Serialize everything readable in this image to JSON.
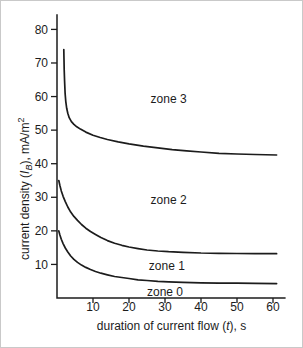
{
  "figure": {
    "background": "#ffffff",
    "border_color": "#c9c9c9",
    "ink_color": "#1c1c1c"
  },
  "axes": {
    "y_title": {
      "pre": "current density (",
      "var": "I",
      "sub": "B",
      "post": "), mA/m",
      "sup": "2"
    },
    "x_title": {
      "pre": "duration of current flow (",
      "var": "t",
      "post": "), s"
    }
  },
  "chart_data": {
    "type": "line",
    "title": "",
    "xlabel": "duration of current flow (t), s",
    "ylabel": "current density (I_B), mA/m^2",
    "xlim": [
      0,
      63.5
    ],
    "ylim": [
      0,
      84.5
    ],
    "x_ticks": [
      10,
      20,
      30,
      40,
      50,
      60
    ],
    "y_ticks": [
      10,
      20,
      30,
      40,
      50,
      60,
      70,
      80
    ],
    "grid": false,
    "legend": "none",
    "line_color": "#1c1c1c",
    "line_width": 1.7,
    "series": [
      {
        "name": "zone2-zone3-boundary",
        "points": [
          [
            1.9,
            74
          ],
          [
            1.95,
            71
          ],
          [
            2.0,
            68
          ],
          [
            2.1,
            64.5
          ],
          [
            2.25,
            61
          ],
          [
            2.45,
            58.5
          ],
          [
            2.7,
            56.5
          ],
          [
            3.0,
            55
          ],
          [
            3.4,
            53.7
          ],
          [
            4.0,
            52.5
          ],
          [
            4.7,
            51.7
          ],
          [
            5.5,
            51
          ],
          [
            6.5,
            50.3
          ],
          [
            8,
            49.4
          ],
          [
            10,
            48.5
          ],
          [
            12,
            47.8
          ],
          [
            14,
            47.2
          ],
          [
            17,
            46.5
          ],
          [
            20,
            45.9
          ],
          [
            24,
            45.2
          ],
          [
            28,
            44.7
          ],
          [
            32,
            44.2
          ],
          [
            36,
            43.8
          ],
          [
            40,
            43.5
          ],
          [
            45,
            43.1
          ],
          [
            50,
            42.9
          ],
          [
            55,
            42.75
          ],
          [
            61,
            42.6
          ]
        ]
      },
      {
        "name": "zone1-zone2-boundary",
        "points": [
          [
            0.5,
            35
          ],
          [
            0.8,
            33.5
          ],
          [
            1.2,
            31.9
          ],
          [
            1.7,
            30.3
          ],
          [
            2.3,
            28.7
          ],
          [
            3.0,
            27.1
          ],
          [
            3.8,
            25.6
          ],
          [
            4.7,
            24.3
          ],
          [
            5.7,
            23.1
          ],
          [
            6.8,
            21.9
          ],
          [
            8.0,
            20.8
          ],
          [
            9.3,
            19.8
          ],
          [
            10.7,
            18.9
          ],
          [
            12.2,
            18.0
          ],
          [
            14,
            17.1
          ],
          [
            16,
            16.3
          ],
          [
            18,
            15.7
          ],
          [
            20,
            15.2
          ],
          [
            22.5,
            14.7
          ],
          [
            25,
            14.3
          ],
          [
            28,
            14.0
          ],
          [
            31,
            13.8
          ],
          [
            35,
            13.6
          ],
          [
            40,
            13.4
          ],
          [
            45,
            13.3
          ],
          [
            50,
            13.25
          ],
          [
            55,
            13.2
          ],
          [
            61,
            13.2
          ]
        ]
      },
      {
        "name": "zone0-zone1-boundary",
        "points": [
          [
            0.5,
            20
          ],
          [
            0.8,
            18.8
          ],
          [
            1.2,
            17.5
          ],
          [
            1.7,
            16.2
          ],
          [
            2.3,
            14.9
          ],
          [
            3.0,
            13.7
          ],
          [
            3.8,
            12.5
          ],
          [
            4.7,
            11.5
          ],
          [
            5.7,
            10.6
          ],
          [
            6.8,
            9.8
          ],
          [
            8.0,
            9.1
          ],
          [
            9.3,
            8.5
          ],
          [
            10.7,
            7.9
          ],
          [
            12.2,
            7.4
          ],
          [
            14,
            6.9
          ],
          [
            16,
            6.4
          ],
          [
            18,
            6.1
          ],
          [
            20,
            5.8
          ],
          [
            22.5,
            5.4
          ],
          [
            25,
            5.2
          ],
          [
            28,
            4.95
          ],
          [
            31,
            4.8
          ],
          [
            35,
            4.65
          ],
          [
            40,
            4.5
          ],
          [
            45,
            4.45
          ],
          [
            50,
            4.4
          ],
          [
            55,
            4.35
          ],
          [
            61,
            4.3
          ]
        ]
      }
    ],
    "zone_labels": [
      {
        "text": "zone 3",
        "x": 31.0,
        "y": 59.3
      },
      {
        "text": "zone 2",
        "x": 31.0,
        "y": 29.2
      },
      {
        "text": "zone 1",
        "x": 30.5,
        "y": 9.6
      },
      {
        "text": "zone 0",
        "x": 30.0,
        "y": 1.9
      }
    ]
  }
}
